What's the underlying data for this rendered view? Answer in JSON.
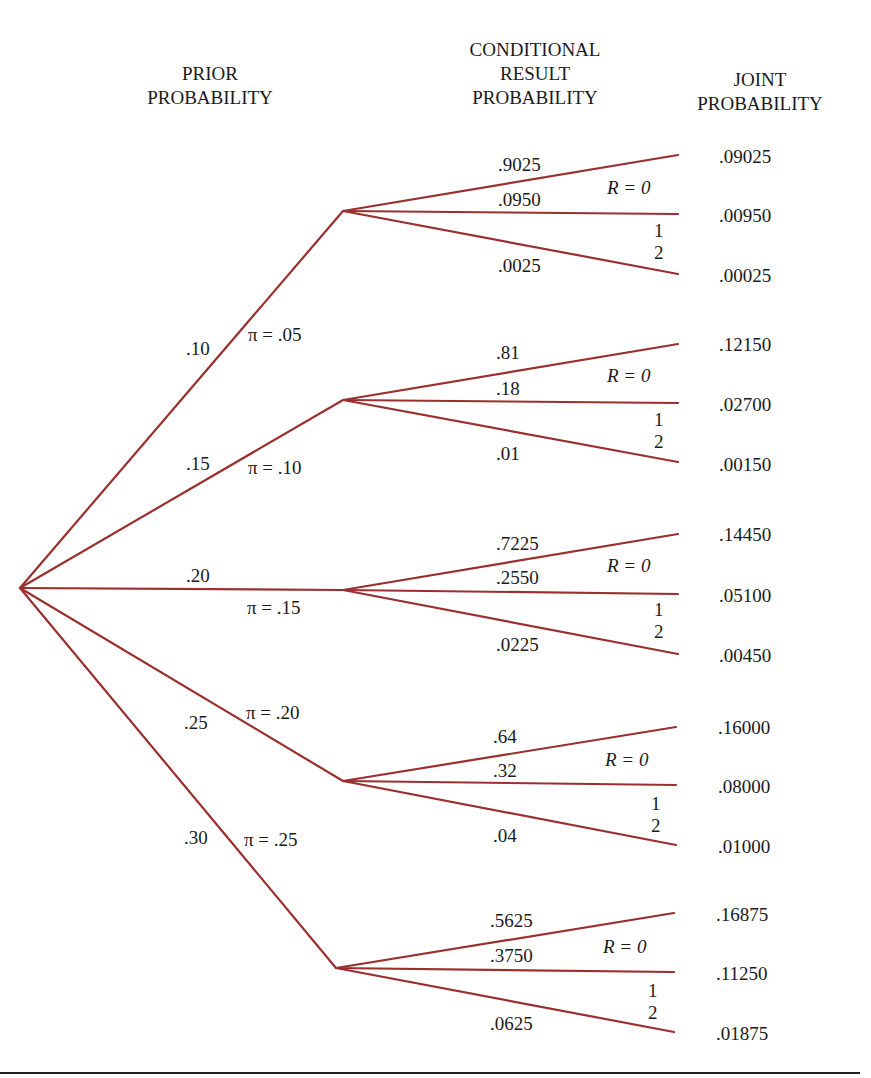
{
  "headers": {
    "prior": [
      "PRIOR",
      "PROBABILITY"
    ],
    "conditional": [
      "CONDITIONAL",
      "RESULT",
      "PROBABILITY"
    ],
    "joint": [
      "JOINT",
      "PROBABILITY"
    ]
  },
  "colors": {
    "branch_line": "#9b2f2f",
    "rule": "#222222"
  },
  "result_labels": {
    "r0": "R = 0",
    "r1": "1",
    "r2": "2"
  },
  "branches": [
    {
      "prior": ".10",
      "pi": "π = .05",
      "conditional": [
        ".9025",
        ".0950",
        ".0025"
      ],
      "joint": [
        ".09025",
        ".00950",
        ".00025"
      ]
    },
    {
      "prior": ".15",
      "pi": "π = .10",
      "conditional": [
        ".81",
        ".18",
        ".01"
      ],
      "joint": [
        ".12150",
        ".02700",
        ".00150"
      ]
    },
    {
      "prior": ".20",
      "pi": "π = .15",
      "conditional": [
        ".7225",
        ".2550",
        ".0225"
      ],
      "joint": [
        ".14450",
        ".05100",
        ".00450"
      ]
    },
    {
      "prior": ".25",
      "pi": "π = .20",
      "conditional": [
        ".64",
        ".32",
        ".04"
      ],
      "joint": [
        ".16000",
        ".08000",
        ".01000"
      ]
    },
    {
      "prior": ".30",
      "pi": "π = .25",
      "conditional": [
        ".5625",
        ".3750",
        ".0625"
      ],
      "joint": [
        ".16875",
        ".11250",
        ".01875"
      ]
    }
  ]
}
